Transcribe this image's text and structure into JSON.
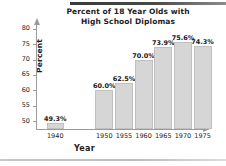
{
  "chart_data": {
    "type": "bar",
    "title": "Percent of 18 Year Olds with High School Diplomas",
    "title_line1": "Percent of 18 Year Olds with",
    "title_line2": "High School Diplomas",
    "xlabel": "Year",
    "ylabel": "Percent",
    "categories": [
      "1940",
      "1950",
      "1955",
      "1960",
      "1965",
      "1970",
      "1975"
    ],
    "values": [
      49.3,
      60.0,
      62.5,
      70.0,
      73.9,
      75.6,
      74.3
    ],
    "value_labels": [
      "49.3%",
      "60.0%",
      "62.5%",
      "70.0%",
      "73.9%",
      "75.6%",
      "74.3%"
    ],
    "ylim": [
      47.5,
      81.5
    ],
    "yticks": [
      50,
      55,
      60,
      65,
      70,
      75,
      80
    ],
    "ytick_labels": [
      "50",
      "55",
      "60",
      "65",
      "70",
      "75",
      "80"
    ],
    "grid": false,
    "legend": null,
    "bar_color": "#d6d6d6",
    "bar_border_color": "#c0c0c0",
    "axis_color": "#9a9a9a",
    "text_color": "#1d1d1d",
    "note": "axis is broken between 1940 and 1950 categories"
  }
}
